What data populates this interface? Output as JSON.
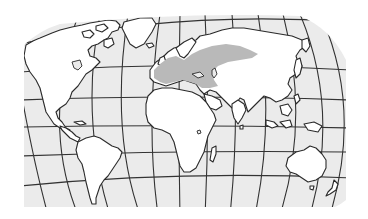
{
  "map": {
    "projection": "curved-graticule world map",
    "colors": {
      "background": "#ffffff",
      "ocean": "#ebebeb",
      "land": "#ffffff",
      "coast": "#2a2a2a",
      "grid": "#333333",
      "highlight": "#b9b9b9"
    },
    "highlighted_region": "Europe and western Russia",
    "continents": [
      "North America",
      "Greenland",
      "South America",
      "Europe",
      "Africa",
      "Asia",
      "Australia"
    ]
  }
}
